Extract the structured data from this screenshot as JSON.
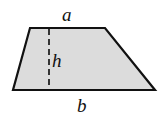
{
  "diagram": {
    "shape": {
      "type": "trapezoid",
      "fill": "#dcdcdc",
      "stroke": "#111111",
      "points": [
        [
          30,
          28
        ],
        [
          105,
          28
        ],
        [
          155,
          90
        ],
        [
          13,
          90
        ]
      ]
    },
    "height_line": {
      "x": 49,
      "y1": 28,
      "y2": 90,
      "style": "dashed"
    },
    "labels": {
      "top": "a",
      "height": "h",
      "bottom": "b"
    }
  }
}
